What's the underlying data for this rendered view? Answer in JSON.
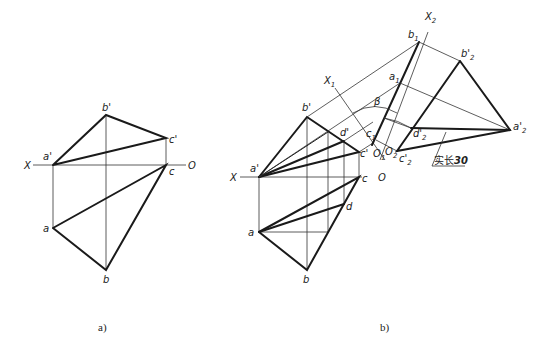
{
  "figure_a": {
    "caption": "a)",
    "labels": {
      "X": "X",
      "O": "O",
      "a_prime": "a'",
      "b_prime": "b'",
      "c_prime": "c'",
      "a": "a",
      "b": "b",
      "c": "c"
    }
  },
  "figure_b": {
    "caption": "b)",
    "labels": {
      "X": "X",
      "O": "O",
      "a_prime": "a'",
      "b_prime": "b'",
      "c_prime": "c'",
      "d_prime": "d'",
      "a": "a",
      "b": "b",
      "c": "c",
      "d": "d",
      "X1": "X",
      "X1_sub": "1",
      "X2": "X",
      "X2_sub": "2",
      "a1": "a",
      "a1_sub": "1",
      "b1": "b",
      "b1_sub": "1",
      "c1": "c",
      "c1_sub": "1",
      "O1": "O",
      "O1_sub": "1",
      "O2": "O",
      "O2_sub": "2",
      "a2p": "a'",
      "a2p_sub": "2",
      "b2p": "b'",
      "b2p_sub": "2",
      "c2p": "c'",
      "c2p_sub": "2",
      "d2p": "d'",
      "d2p_sub": "2",
      "beta": "β"
    },
    "annotation": {
      "text_cn": "实长",
      "value": "30"
    }
  }
}
